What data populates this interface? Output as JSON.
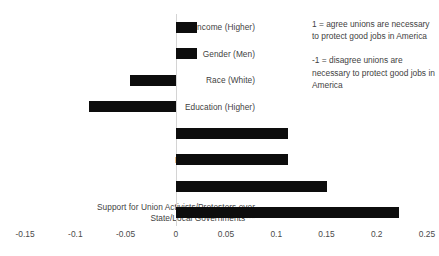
{
  "chart_data": {
    "type": "bar",
    "orientation": "horizontal",
    "title": "",
    "xlabel": "",
    "ylabel": "",
    "categories": [
      "Income (Higher)",
      "Gender (Men)",
      "Race (White)",
      "Education (Higher)",
      "Age (Older)",
      "Party (Democratic)***",
      "Ideology (Liberal)*",
      "Support for Union Activists/Protesters over\nState/Local Governments***"
    ],
    "values": [
      0.021,
      0.021,
      -0.046,
      -0.086,
      0.112,
      0.112,
      0.151,
      0.222
    ],
    "xlim": [
      -0.175,
      0.262
    ],
    "xticks": [
      -0.15,
      -0.1,
      -0.05,
      0,
      0.05,
      0.1,
      0.15,
      0.2,
      0.25
    ],
    "xticklabels": [
      "-0.15",
      "-0.1",
      "-0.05",
      "0",
      "0.05",
      "0.1",
      "0.15",
      "0.2",
      "0.25"
    ],
    "grid": false,
    "legend": false,
    "bar_color": "#0d0d0d",
    "axis_color": "#d4d4d4"
  },
  "annotations": [
    "1 = agree unions are necessary to protect good jobs in America",
    "-1 = disagree unions are necessary to protect good jobs in America"
  ]
}
